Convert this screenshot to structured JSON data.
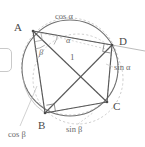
{
  "figure": {
    "vertices": [
      {
        "id": "A",
        "label": "A",
        "x": 33,
        "y": 31,
        "label_x": 14,
        "label_y": 22
      },
      {
        "id": "D",
        "label": "D",
        "x": 112,
        "y": 45,
        "label_x": 119,
        "label_y": 36
      },
      {
        "id": "C",
        "label": "C",
        "x": 107,
        "y": 102,
        "label_x": 113,
        "label_y": 101
      },
      {
        "id": "B",
        "label": "B",
        "x": 45,
        "y": 113,
        "label_x": 38,
        "label_y": 120
      }
    ],
    "measures": [
      {
        "id": "cos-alpha",
        "label": "cos α",
        "x": 55,
        "y": 16
      },
      {
        "id": "sin-alpha",
        "label": "sin α",
        "x": 114,
        "y": 67
      },
      {
        "id": "sin-beta",
        "label": "sin β",
        "x": 66,
        "y": 127
      },
      {
        "id": "cos-beta",
        "label": "cos β",
        "x": 8,
        "y": 131
      },
      {
        "id": "diagonal-one",
        "label": "1",
        "x": 70,
        "y": 57
      }
    ],
    "angles": [
      {
        "id": "alpha",
        "label": "α",
        "x": 66,
        "y": 40
      },
      {
        "id": "beta",
        "label": "β",
        "x": 39,
        "y": 52
      }
    ],
    "circle": {
      "center_x": 70,
      "center_y": 68,
      "radius": 48,
      "stroke": "#6f6f6f"
    },
    "thales_circles": [
      {
        "id": "thales-ac",
        "center_x": 70,
        "center_y": 66.5,
        "radius": 48.5,
        "stroke": "#b9b9b9"
      },
      {
        "id": "thales-bd",
        "center_x": 78.5,
        "center_y": 79,
        "radius": 45.5,
        "stroke": "#b9b9b9"
      }
    ],
    "colors": {
      "main_stroke": "#585858",
      "circle_stroke": "#6f6f6f",
      "dashed_stroke": "#b9b9b9",
      "leader_stroke": "#b0b0b0",
      "text": "#5a5a5a",
      "background": "#ffffff"
    }
  },
  "widget": {
    "name": "cropped-panel-stub",
    "visible": true
  }
}
